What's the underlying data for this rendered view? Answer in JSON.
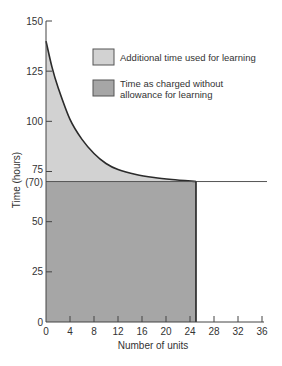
{
  "chart_data": {
    "type": "area",
    "title": "",
    "xlabel": "Number of units",
    "ylabel": "Time (hours)",
    "xlim": [
      0,
      36
    ],
    "ylim": [
      0,
      150
    ],
    "x_ticks": [
      0,
      4,
      8,
      12,
      16,
      20,
      24,
      28,
      32,
      36
    ],
    "y_ticks": [
      {
        "value": 0,
        "label": "0"
      },
      {
        "value": 25,
        "label": "25"
      },
      {
        "value": 50,
        "label": "50"
      },
      {
        "value": 70,
        "label": "(70)"
      },
      {
        "value": 75,
        "label": "75"
      },
      {
        "value": 100,
        "label": "100"
      },
      {
        "value": 125,
        "label": "125"
      },
      {
        "value": 150,
        "label": "150"
      }
    ],
    "grid": false,
    "legend_position": "upper right (inside)",
    "series": [
      {
        "name": "Additional time used for learning",
        "kind": "area-between-curve-and-70",
        "color": "#d2d2d2",
        "x": [
          0,
          1,
          2,
          4,
          6,
          8,
          10,
          12,
          15,
          18,
          21,
          25
        ],
        "values": [
          140,
          127,
          117,
          101,
          91,
          84,
          79,
          76,
          73.5,
          72,
          71,
          70
        ]
      },
      {
        "name": "Time as charged without allowance for learning",
        "kind": "rectangle",
        "color": "#a6a6a6",
        "x": [
          0,
          25
        ],
        "values": [
          70,
          70
        ]
      }
    ],
    "annotations": [
      {
        "type": "horizontal-line",
        "y": 70,
        "x_from": 0,
        "x_to": 36.5
      },
      {
        "type": "vertical-line",
        "x": 25,
        "y_from": 0,
        "y_to": 70
      }
    ]
  },
  "legend": {
    "items": [
      {
        "line1": "Additional time used for learning",
        "line2": "",
        "color": "#d2d2d2"
      },
      {
        "line1": "Time as charged without",
        "line2": "allowance for learning",
        "color": "#a6a6a6"
      }
    ]
  },
  "axes": {
    "x_title": "Number of units",
    "y_title": "Time (hours)"
  }
}
